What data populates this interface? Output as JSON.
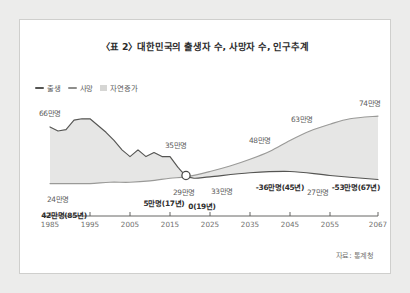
{
  "figure": {
    "title": "〈표 2〉대한민국의 출생자 수, 사망자 수, 인구추계",
    "source_note": "자료: 통계청"
  },
  "legend": {
    "position": "top-left",
    "items": [
      {
        "label": "출생",
        "color": "#555553",
        "marker": "line"
      },
      {
        "label": "사망",
        "color": "#8e8e8c",
        "marker": "line"
      },
      {
        "label": "자연증가",
        "color": "#d6d6d4",
        "marker": "block"
      }
    ]
  },
  "chart_data": {
    "type": "line",
    "title": "〈표 2〉대한민국의 출생자 수, 사망자 수, 인구추계",
    "xlabel": "",
    "ylabel": "",
    "xlim": [
      1983,
      2067
    ],
    "ylim": [
      0,
      80
    ],
    "grid": false,
    "legend_position": "top-left",
    "xticks": [
      "1985",
      "1995",
      "2005",
      "2015",
      "2025",
      "2035",
      "2045",
      "2055",
      "2067"
    ],
    "series": [
      {
        "name": "출생",
        "color": "#555553",
        "unit": "만명",
        "x": [
          1985,
          1987,
          1989,
          1991,
          1993,
          1995,
          1997,
          1999,
          2001,
          2003,
          2005,
          2007,
          2009,
          2011,
          2013,
          2015,
          2017,
          2019,
          2021,
          2025,
          2035,
          2045,
          2055,
          2067
        ],
        "values": [
          66,
          63,
          64,
          71,
          72,
          72,
          67,
          62,
          56,
          49,
          44,
          49,
          44,
          47,
          44,
          44,
          36,
          30,
          28,
          29,
          32,
          33,
          30,
          27
        ]
      },
      {
        "name": "사망",
        "color": "#8e8e8c",
        "unit": "만명",
        "x": [
          1985,
          1990,
          1995,
          2000,
          2005,
          2010,
          2015,
          2019,
          2025,
          2030,
          2035,
          2040,
          2045,
          2050,
          2055,
          2060,
          2067
        ],
        "values": [
          24,
          24,
          24,
          25,
          25,
          26,
          28,
          29,
          33,
          37,
          42,
          48,
          56,
          63,
          68,
          72,
          74
        ]
      }
    ],
    "annotations": [
      {
        "text": "66만명",
        "x": 1985,
        "value": 66,
        "emphasis": false,
        "series": "출생"
      },
      {
        "text": "42만명(85년)",
        "x": 1985,
        "value": 42,
        "emphasis": true,
        "series": "자연증가"
      },
      {
        "text": "24만명",
        "x": 1986,
        "value": 24,
        "emphasis": false,
        "series": "사망"
      },
      {
        "text": "5만명(17년)",
        "x": 2017,
        "value": 5,
        "emphasis": true,
        "series": "자연증가"
      },
      {
        "text": "35만명",
        "x": 2016,
        "value": 35,
        "emphasis": false,
        "series": "출생"
      },
      {
        "text": "29만명",
        "x": 2019,
        "value": 29,
        "emphasis": false,
        "series": "사망"
      },
      {
        "text": "0(19년)",
        "x": 2019,
        "value": 0,
        "emphasis": true,
        "series": "자연증가"
      },
      {
        "text": "33만명",
        "x": 2028,
        "value": 33,
        "emphasis": false,
        "series": "출생"
      },
      {
        "text": "48만명",
        "x": 2040,
        "value": 48,
        "emphasis": false,
        "series": "사망"
      },
      {
        "text": "-36만명(45년)",
        "x": 2045,
        "value": -36,
        "emphasis": true,
        "series": "자연증가"
      },
      {
        "text": "63만명",
        "x": 2050,
        "value": 63,
        "emphasis": false,
        "series": "사망"
      },
      {
        "text": "27만명",
        "x": 2052,
        "value": 27,
        "emphasis": false,
        "series": "출생"
      },
      {
        "text": "-53만명(67년)",
        "x": 2067,
        "value": -53,
        "emphasis": true,
        "series": "자연증가"
      },
      {
        "text": "74만명",
        "x": 2065,
        "value": 74,
        "emphasis": false,
        "series": "사망"
      }
    ],
    "crossover_marker": {
      "x": 2019,
      "label": "0(19년)"
    }
  }
}
